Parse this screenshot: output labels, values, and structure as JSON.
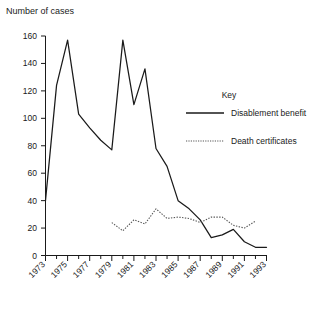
{
  "chart_data": {
    "type": "line",
    "title": "",
    "ylabel": "Number of cases",
    "xlabel": "",
    "ylim": [
      0,
      160
    ],
    "ytick_labels": [
      "0",
      "20",
      "40",
      "60",
      "80",
      "100",
      "120",
      "140",
      "160"
    ],
    "ytick_values": [
      0,
      20,
      40,
      60,
      80,
      100,
      120,
      140,
      160
    ],
    "xlim": [
      1973,
      1993
    ],
    "xtick_labels": [
      "1973",
      "1975",
      "1977",
      "1979",
      "1981",
      "1983",
      "1985",
      "1987",
      "1989",
      "1991",
      "1993"
    ],
    "xtick_values": [
      1973,
      1975,
      1977,
      1979,
      1981,
      1983,
      1985,
      1987,
      1989,
      1991,
      1993
    ],
    "minor_xticks_every": 1,
    "grid": false,
    "legend_position": "right-middle",
    "legend_title": "Key",
    "series": [
      {
        "name": "Disablement benefit",
        "style": "solid",
        "color": "#1a1a1a",
        "x": [
          1973,
          1974,
          1975,
          1976,
          1977,
          1978,
          1979,
          1980,
          1981,
          1982,
          1983,
          1984,
          1985,
          1986,
          1987,
          1988,
          1989,
          1990,
          1991,
          1992,
          1993
        ],
        "values": [
          40,
          124,
          157,
          103,
          93,
          84,
          77,
          157,
          110,
          136,
          78,
          65,
          40,
          34,
          26,
          13,
          15,
          19,
          10,
          6,
          6
        ]
      },
      {
        "name": "Death certificates",
        "style": "dotted",
        "color": "#555555",
        "x": [
          1979,
          1980,
          1981,
          1982,
          1983,
          1984,
          1985,
          1986,
          1987,
          1988,
          1989,
          1990,
          1991,
          1992
        ],
        "values": [
          24,
          18,
          26,
          23,
          34,
          27,
          28,
          27,
          24,
          28,
          28,
          22,
          20,
          25
        ]
      }
    ]
  },
  "legend": {
    "title": "Key",
    "entries": [
      {
        "label": "Disablement benefit",
        "style": "solid"
      },
      {
        "label": "Death certificates",
        "style": "dotted"
      }
    ]
  },
  "axis": {
    "y_title": "Number of cases"
  }
}
